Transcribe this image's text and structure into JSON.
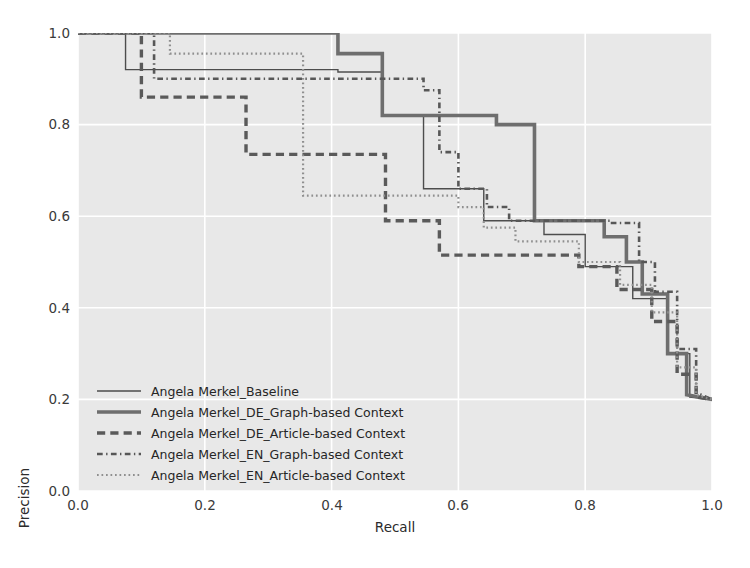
{
  "chart_data": {
    "type": "line",
    "title": "",
    "xlabel": "Recall",
    "ylabel": "Precision",
    "xlim": [
      0.0,
      1.0
    ],
    "ylim": [
      0.0,
      1.0
    ],
    "xticks": [
      "0.0",
      "0.2",
      "0.4",
      "0.6",
      "0.8",
      "1.0"
    ],
    "yticks": [
      "0.0",
      "0.2",
      "0.4",
      "0.6",
      "0.8",
      "1.0"
    ],
    "xtick_values": [
      0.0,
      0.2,
      0.4,
      0.6,
      0.8,
      1.0
    ],
    "ytick_values": [
      0.0,
      0.2,
      0.4,
      0.6,
      0.8,
      1.0
    ],
    "grid": true,
    "grid_color": "#ffffff",
    "plot_background": "#e8e8e8",
    "legend_position": "lower left",
    "series": [
      {
        "name": "Angela Merkel_Baseline",
        "style": "solid",
        "width": 1.4,
        "color": "#4d4d4d",
        "points": [
          [
            0.0,
            1.0
          ],
          [
            0.075,
            1.0
          ],
          [
            0.075,
            0.92
          ],
          [
            0.41,
            0.92
          ],
          [
            0.41,
            0.915
          ],
          [
            0.48,
            0.915
          ],
          [
            0.48,
            0.82
          ],
          [
            0.545,
            0.82
          ],
          [
            0.545,
            0.66
          ],
          [
            0.64,
            0.66
          ],
          [
            0.64,
            0.59
          ],
          [
            0.735,
            0.59
          ],
          [
            0.735,
            0.56
          ],
          [
            0.8,
            0.56
          ],
          [
            0.8,
            0.49
          ],
          [
            0.875,
            0.49
          ],
          [
            0.875,
            0.42
          ],
          [
            0.93,
            0.42
          ],
          [
            0.93,
            0.3
          ],
          [
            0.965,
            0.3
          ],
          [
            0.965,
            0.205
          ],
          [
            1.0,
            0.2
          ]
        ]
      },
      {
        "name": "Angela Merkel_DE_Graph-based Context",
        "style": "solid",
        "width": 3.6,
        "color": "#6e6e6e",
        "points": [
          [
            0.0,
            1.0
          ],
          [
            0.41,
            1.0
          ],
          [
            0.41,
            0.955
          ],
          [
            0.48,
            0.955
          ],
          [
            0.48,
            0.82
          ],
          [
            0.66,
            0.82
          ],
          [
            0.66,
            0.8
          ],
          [
            0.72,
            0.8
          ],
          [
            0.72,
            0.59
          ],
          [
            0.83,
            0.59
          ],
          [
            0.83,
            0.555
          ],
          [
            0.865,
            0.555
          ],
          [
            0.865,
            0.5
          ],
          [
            0.89,
            0.5
          ],
          [
            0.89,
            0.43
          ],
          [
            0.93,
            0.43
          ],
          [
            0.93,
            0.3
          ],
          [
            0.96,
            0.3
          ],
          [
            0.96,
            0.21
          ],
          [
            1.0,
            0.2
          ]
        ]
      },
      {
        "name": "Angela Merkel_DE_Article-based Context",
        "style": "dashed",
        "width": 3.4,
        "color": "#5a5a5a",
        "points": [
          [
            0.0,
            1.0
          ],
          [
            0.1,
            1.0
          ],
          [
            0.1,
            0.86
          ],
          [
            0.265,
            0.86
          ],
          [
            0.265,
            0.735
          ],
          [
            0.485,
            0.735
          ],
          [
            0.485,
            0.59
          ],
          [
            0.57,
            0.59
          ],
          [
            0.57,
            0.515
          ],
          [
            0.79,
            0.515
          ],
          [
            0.79,
            0.49
          ],
          [
            0.85,
            0.49
          ],
          [
            0.85,
            0.44
          ],
          [
            0.905,
            0.44
          ],
          [
            0.905,
            0.37
          ],
          [
            0.945,
            0.37
          ],
          [
            0.945,
            0.255
          ],
          [
            0.975,
            0.255
          ],
          [
            0.975,
            0.205
          ],
          [
            1.0,
            0.2
          ]
        ]
      },
      {
        "name": "Angela Merkel_EN_Graph-based Context",
        "style": "dashdot",
        "width": 2.6,
        "color": "#575757",
        "points": [
          [
            0.0,
            1.0
          ],
          [
            0.12,
            1.0
          ],
          [
            0.12,
            0.9
          ],
          [
            0.545,
            0.9
          ],
          [
            0.545,
            0.875
          ],
          [
            0.57,
            0.875
          ],
          [
            0.57,
            0.74
          ],
          [
            0.6,
            0.74
          ],
          [
            0.6,
            0.66
          ],
          [
            0.645,
            0.66
          ],
          [
            0.645,
            0.62
          ],
          [
            0.68,
            0.62
          ],
          [
            0.68,
            0.59
          ],
          [
            0.84,
            0.59
          ],
          [
            0.84,
            0.585
          ],
          [
            0.885,
            0.585
          ],
          [
            0.885,
            0.5
          ],
          [
            0.91,
            0.5
          ],
          [
            0.91,
            0.435
          ],
          [
            0.945,
            0.435
          ],
          [
            0.945,
            0.31
          ],
          [
            0.975,
            0.31
          ],
          [
            0.975,
            0.215
          ],
          [
            1.0,
            0.2
          ]
        ]
      },
      {
        "name": "Angela Merkel_EN_Article-based Context",
        "style": "dotted",
        "width": 2.2,
        "color": "#8f8f8f",
        "points": [
          [
            0.0,
            1.0
          ],
          [
            0.145,
            1.0
          ],
          [
            0.145,
            0.955
          ],
          [
            0.355,
            0.955
          ],
          [
            0.355,
            0.645
          ],
          [
            0.6,
            0.645
          ],
          [
            0.6,
            0.62
          ],
          [
            0.64,
            0.62
          ],
          [
            0.64,
            0.575
          ],
          [
            0.69,
            0.575
          ],
          [
            0.69,
            0.545
          ],
          [
            0.79,
            0.545
          ],
          [
            0.79,
            0.5
          ],
          [
            0.855,
            0.5
          ],
          [
            0.855,
            0.45
          ],
          [
            0.905,
            0.45
          ],
          [
            0.905,
            0.39
          ],
          [
            0.945,
            0.39
          ],
          [
            0.945,
            0.27
          ],
          [
            0.975,
            0.27
          ],
          [
            0.975,
            0.21
          ],
          [
            1.0,
            0.2
          ]
        ]
      }
    ]
  },
  "legend": {
    "entries": [
      {
        "label": "Angela Merkel_Baseline"
      },
      {
        "label": "Angela Merkel_DE_Graph-based Context"
      },
      {
        "label": "Angela Merkel_DE_Article-based Context"
      },
      {
        "label": "Angela Merkel_EN_Graph-based Context"
      },
      {
        "label": "Angela Merkel_EN_Article-based Context"
      }
    ]
  }
}
